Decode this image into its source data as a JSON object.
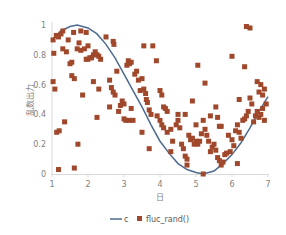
{
  "chart_data": {
    "type": "scatter",
    "title": "",
    "xlabel": "日",
    "ylabel": "乱数出力",
    "xlim": [
      1,
      7
    ],
    "ylim": [
      0,
      1
    ],
    "xticks": [
      1,
      2,
      3,
      4,
      5,
      6,
      7
    ],
    "yticks": [
      0,
      0.2,
      0.4,
      0.6,
      0.8,
      1
    ],
    "ytick_labels": [
      "0",
      "0.2",
      "0.4",
      "0.6",
      "0.8",
      "1"
    ],
    "grid": false,
    "legend_position": "bottom",
    "series": [
      {
        "name": "c",
        "kind": "line",
        "color": "#4e6b8f",
        "points": [
          [
            1.0,
            0.9
          ],
          [
            1.25,
            0.96
          ],
          [
            1.5,
            0.99
          ],
          [
            1.7,
            1.0
          ],
          [
            2.0,
            0.98
          ],
          [
            2.25,
            0.94
          ],
          [
            2.5,
            0.87
          ],
          [
            2.75,
            0.78
          ],
          [
            3.0,
            0.67
          ],
          [
            3.25,
            0.56
          ],
          [
            3.5,
            0.45
          ],
          [
            3.75,
            0.33
          ],
          [
            4.0,
            0.22
          ],
          [
            4.25,
            0.14
          ],
          [
            4.5,
            0.07
          ],
          [
            4.75,
            0.03
          ],
          [
            5.0,
            0.01
          ],
          [
            5.2,
            0.0
          ],
          [
            5.5,
            0.02
          ],
          [
            5.75,
            0.07
          ],
          [
            6.0,
            0.13
          ],
          [
            6.25,
            0.21
          ],
          [
            6.5,
            0.31
          ],
          [
            6.75,
            0.42
          ],
          [
            7.0,
            0.52
          ]
        ]
      },
      {
        "name": "fluc_rand()",
        "kind": "scatter",
        "color": "#a0482b",
        "points": [
          [
            1.03,
            0.62
          ],
          [
            1.08,
            0.57
          ],
          [
            1.03,
            0.9
          ],
          [
            1.05,
            0.81
          ],
          [
            1.12,
            0.93
          ],
          [
            1.18,
            0.92
          ],
          [
            1.25,
            0.94
          ],
          [
            1.3,
            0.96
          ],
          [
            1.13,
            0.28
          ],
          [
            1.2,
            0.29
          ],
          [
            1.35,
            0.35
          ],
          [
            1.18,
            0.03
          ],
          [
            1.3,
            0.84
          ],
          [
            1.4,
            0.82
          ],
          [
            1.5,
            0.74
          ],
          [
            1.55,
            0.75
          ],
          [
            1.45,
            0.9
          ],
          [
            1.6,
            0.95
          ],
          [
            1.55,
            0.66
          ],
          [
            1.62,
            0.64
          ],
          [
            1.62,
            0.04
          ],
          [
            1.72,
            0.2
          ],
          [
            1.75,
            0.88
          ],
          [
            1.8,
            0.96
          ],
          [
            1.7,
            0.84
          ],
          [
            1.8,
            0.83
          ],
          [
            1.95,
            0.95
          ],
          [
            1.85,
            0.53
          ],
          [
            1.9,
            0.84
          ],
          [
            1.95,
            0.77
          ],
          [
            2.0,
            0.77
          ],
          [
            2.05,
            0.78
          ],
          [
            2.1,
            0.78
          ],
          [
            2.0,
            0.86
          ],
          [
            2.15,
            0.8
          ],
          [
            2.2,
            0.82
          ],
          [
            2.25,
            0.8
          ],
          [
            2.3,
            0.79
          ],
          [
            2.35,
            0.77
          ],
          [
            2.15,
            0.62
          ],
          [
            2.3,
            0.57
          ],
          [
            2.25,
            0.38
          ],
          [
            2.5,
            0.92
          ],
          [
            2.6,
            0.63
          ],
          [
            2.65,
            0.58
          ],
          [
            2.7,
            0.55
          ],
          [
            2.75,
            0.53
          ],
          [
            2.6,
            0.45
          ],
          [
            2.7,
            0.89
          ],
          [
            2.72,
            0.87
          ],
          [
            2.8,
            0.69
          ],
          [
            2.85,
            0.42
          ],
          [
            2.9,
            0.46
          ],
          [
            2.95,
            0.49
          ],
          [
            3.0,
            0.47
          ],
          [
            3.0,
            0.37
          ],
          [
            3.05,
            0.36
          ],
          [
            3.15,
            0.36
          ],
          [
            3.2,
            0.44
          ],
          [
            3.25,
            0.36
          ],
          [
            3.08,
            0.73
          ],
          [
            3.12,
            0.76
          ],
          [
            3.15,
            0.74
          ],
          [
            3.2,
            0.75
          ],
          [
            3.3,
            0.67
          ],
          [
            3.35,
            0.69
          ],
          [
            3.4,
            0.63
          ],
          [
            3.45,
            0.56
          ],
          [
            3.5,
            0.28
          ],
          [
            3.5,
            0.64
          ],
          [
            3.55,
            0.57
          ],
          [
            3.6,
            0.54
          ],
          [
            3.62,
            0.5
          ],
          [
            3.65,
            0.48
          ],
          [
            3.7,
            0.43
          ],
          [
            3.75,
            0.4
          ],
          [
            3.55,
            0.86
          ],
          [
            3.8,
            0.86
          ],
          [
            3.9,
            0.76
          ],
          [
            3.92,
            0.39
          ],
          [
            3.7,
            0.17
          ],
          [
            4.0,
            0.56
          ],
          [
            4.05,
            0.53
          ],
          [
            4.1,
            0.45
          ],
          [
            4.15,
            0.44
          ],
          [
            4.2,
            0.42
          ],
          [
            4.0,
            0.36
          ],
          [
            4.05,
            0.33
          ],
          [
            4.1,
            0.31
          ],
          [
            4.2,
            0.28
          ],
          [
            4.3,
            0.3
          ],
          [
            4.35,
            0.22
          ],
          [
            4.3,
            0.15
          ],
          [
            4.45,
            0.33
          ],
          [
            4.5,
            0.36
          ],
          [
            4.55,
            0.31
          ],
          [
            4.6,
            0.2
          ],
          [
            4.65,
            0.17
          ],
          [
            4.7,
            0.12
          ],
          [
            4.75,
            0.1
          ],
          [
            4.75,
            0.06
          ],
          [
            4.5,
            0.4
          ],
          [
            4.7,
            0.4
          ],
          [
            4.8,
            0.26
          ],
          [
            4.85,
            0.23
          ],
          [
            4.9,
            0.24
          ],
          [
            4.95,
            0.2
          ],
          [
            5.0,
            0.22
          ],
          [
            5.05,
            0.2
          ],
          [
            5.1,
            0.22
          ],
          [
            5.0,
            0.33
          ],
          [
            4.9,
            0.49
          ],
          [
            5.05,
            0.73
          ],
          [
            5.2,
            0.0
          ],
          [
            5.15,
            0.27
          ],
          [
            5.2,
            0.36
          ],
          [
            5.25,
            0.3
          ],
          [
            5.3,
            0.26
          ],
          [
            5.35,
            0.22
          ],
          [
            5.4,
            0.15
          ],
          [
            5.45,
            0.18
          ],
          [
            5.5,
            0.2
          ],
          [
            5.55,
            0.16
          ],
          [
            5.6,
            0.11
          ],
          [
            5.65,
            0.09
          ],
          [
            5.7,
            0.06
          ],
          [
            5.25,
            0.61
          ],
          [
            5.4,
            0.39
          ],
          [
            5.55,
            0.45
          ],
          [
            5.6,
            0.38
          ],
          [
            5.65,
            0.32
          ],
          [
            5.7,
            0.32
          ],
          [
            5.75,
            0.08
          ],
          [
            5.8,
            0.13
          ],
          [
            5.85,
            0.14
          ],
          [
            5.9,
            0.26
          ],
          [
            5.95,
            0.15
          ],
          [
            6.0,
            0.23
          ],
          [
            6.05,
            0.19
          ],
          [
            6.1,
            0.29
          ],
          [
            6.15,
            0.33
          ],
          [
            6.2,
            0.28
          ],
          [
            6.25,
            0.24
          ],
          [
            6.15,
            0.07
          ],
          [
            6.3,
            0.36
          ],
          [
            6.35,
            0.37
          ],
          [
            6.4,
            0.39
          ],
          [
            6.45,
            0.42
          ],
          [
            6.5,
            0.51
          ],
          [
            6.55,
            0.47
          ],
          [
            6.6,
            0.35
          ],
          [
            6.65,
            0.39
          ],
          [
            6.7,
            0.42
          ],
          [
            6.75,
            0.38
          ],
          [
            6.8,
            0.4
          ],
          [
            6.85,
            0.44
          ],
          [
            6.75,
            0.55
          ],
          [
            6.85,
            0.53
          ],
          [
            6.9,
            0.36
          ],
          [
            6.95,
            0.47
          ],
          [
            6.0,
            0.79
          ],
          [
            6.35,
            0.72
          ],
          [
            6.4,
            0.99
          ],
          [
            6.5,
            0.98
          ],
          [
            6.7,
            0.62
          ],
          [
            6.8,
            0.6
          ],
          [
            6.9,
            0.57
          ],
          [
            6.2,
            0.5
          ]
        ]
      }
    ]
  },
  "legend": {
    "items": [
      {
        "label": "c",
        "marker": "line",
        "color": "#4e6b8f"
      },
      {
        "label": "fluc_rand()",
        "marker": "square",
        "color": "#a0482b"
      }
    ]
  }
}
